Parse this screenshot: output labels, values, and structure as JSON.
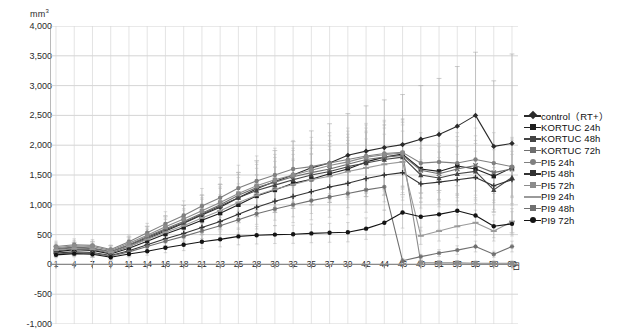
{
  "chart_data": {
    "type": "line",
    "title": "",
    "subtitle": "",
    "xlabel": "日",
    "ylabel": "mm³",
    "ylim": [
      -1000,
      4000
    ],
    "ytick_step": 500,
    "ytick_labels": [
      "4,000",
      "3,500",
      "3,000",
      "2,500",
      "2,000",
      "1,500",
      "1,000",
      "500",
      "0",
      "-500",
      "-1,000"
    ],
    "ytick_values": [
      4000,
      3500,
      3000,
      2500,
      2000,
      1500,
      1000,
      500,
      0,
      -500,
      -1000
    ],
    "grid": "horizontal-and-vertical",
    "legend_position": "right",
    "error_bars": true,
    "x": [
      1,
      4,
      7,
      9,
      11,
      14,
      16,
      18,
      21,
      23,
      25,
      28,
      30,
      32,
      35,
      37,
      39,
      42,
      44,
      46,
      49,
      51,
      53,
      55,
      58,
      60
    ],
    "xtick_labels": [
      "1",
      "4",
      "7",
      "9",
      "11",
      "14",
      "16",
      "18",
      "21",
      "23",
      "25",
      "28",
      "30",
      "32",
      "35",
      "37",
      "39",
      "42",
      "44",
      "46",
      "49",
      "51",
      "53",
      "55",
      "58",
      "60"
    ],
    "series": [
      {
        "name": "control（RT+）",
        "color": "#2b2b2b",
        "marker": "diamond",
        "values": [
          230,
          260,
          250,
          195,
          300,
          430,
          560,
          690,
          830,
          960,
          1120,
          1270,
          1390,
          1500,
          1620,
          1700,
          1830,
          1900,
          1960,
          2010,
          2100,
          2180,
          2320,
          2500,
          1980,
          2030
        ],
        "errors": [
          90,
          110,
          130,
          120,
          160,
          210,
          250,
          300,
          330,
          380,
          420,
          470,
          520,
          560,
          620,
          660,
          700,
          760,
          800,
          840,
          900,
          940,
          1000,
          1060,
          1100,
          1500
        ]
      },
      {
        "name": "KORTUC 24h",
        "color": "#1f1f1f",
        "marker": "square",
        "values": [
          210,
          245,
          235,
          175,
          270,
          390,
          510,
          620,
          740,
          860,
          1000,
          1150,
          1250,
          1360,
          1430,
          1520,
          1600,
          1720,
          1800,
          1850,
          1600,
          1560,
          1650,
          1600,
          1480,
          1620
        ]
      },
      {
        "name": "KORTUC 48h",
        "color": "#444444",
        "marker": "triangle",
        "values": [
          250,
          280,
          265,
          205,
          320,
          450,
          580,
          700,
          840,
          980,
          1120,
          1240,
          1330,
          1420,
          1500,
          1560,
          1640,
          1700,
          1760,
          1800,
          1500,
          1450,
          1520,
          1560,
          1250,
          1460
        ]
      },
      {
        "name": "KORTUC 72h",
        "color": "#6e6e6e",
        "marker": "x",
        "values": [
          265,
          290,
          275,
          215,
          330,
          470,
          600,
          720,
          860,
          1000,
          1160,
          1290,
          1380,
          1470,
          1540,
          1600,
          1680,
          1760,
          1800,
          1830,
          1580,
          1520,
          1600,
          1660,
          1540,
          1600
        ]
      },
      {
        "name": "PI5 24h",
        "color": "#808080",
        "marker": "circle",
        "values": [
          300,
          330,
          320,
          250,
          380,
          530,
          680,
          820,
          980,
          1120,
          1280,
          1400,
          1500,
          1600,
          1640,
          1700,
          1760,
          1820,
          1860,
          1880,
          1700,
          1720,
          1700,
          1760,
          1700,
          1640
        ]
      },
      {
        "name": "PI5 48h",
        "color": "#333333",
        "marker": "plus",
        "values": [
          190,
          210,
          200,
          150,
          230,
          330,
          430,
          520,
          620,
          720,
          840,
          960,
          1060,
          1140,
          1220,
          1300,
          1360,
          1440,
          1500,
          1540,
          1350,
          1380,
          1420,
          1460,
          1320,
          1420
        ]
      },
      {
        "name": "PI5 72h",
        "color": "#8c8c8c",
        "marker": "square",
        "values": [
          280,
          310,
          300,
          235,
          355,
          490,
          630,
          760,
          900,
          1040,
          1190,
          1320,
          1420,
          1500,
          1580,
          1660,
          1720,
          1800,
          1840,
          1870,
          30,
          25,
          25,
          20,
          20,
          20
        ]
      },
      {
        "name": "PI9 24h",
        "color": "#9a9a9a",
        "marker": "dash",
        "values": [
          240,
          265,
          255,
          200,
          305,
          420,
          540,
          650,
          780,
          900,
          1040,
          1160,
          1260,
          1340,
          1420,
          1480,
          1560,
          1620,
          1680,
          1720,
          480,
          560,
          640,
          700,
          560,
          720
        ]
      },
      {
        "name": "PI9 48h",
        "color": "#707070",
        "marker": "star",
        "values": [
          175,
          195,
          185,
          140,
          210,
          300,
          390,
          470,
          560,
          650,
          750,
          850,
          930,
          1000,
          1070,
          1130,
          1190,
          1250,
          1300,
          60,
          130,
          190,
          240,
          300,
          170,
          300
        ]
      },
      {
        "name": "PI9 72h",
        "color": "#141414",
        "marker": "circle-filled",
        "values": [
          160,
          180,
          170,
          120,
          175,
          220,
          280,
          330,
          380,
          420,
          470,
          490,
          500,
          505,
          520,
          530,
          540,
          600,
          700,
          870,
          800,
          840,
          900,
          820,
          640,
          680
        ]
      }
    ]
  }
}
